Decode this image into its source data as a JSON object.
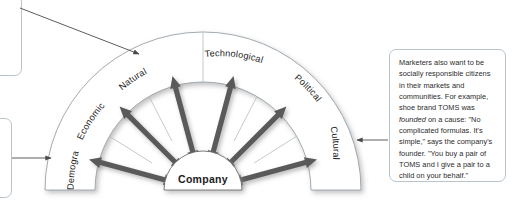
{
  "diagram": {
    "center_label": "Company",
    "segments": [
      {
        "id": "demographic",
        "label": "Demographic"
      },
      {
        "id": "economic",
        "label": "Economic"
      },
      {
        "id": "natural",
        "label": "Natural"
      },
      {
        "id": "technological",
        "label": "Technological"
      },
      {
        "id": "political",
        "label": "Political"
      },
      {
        "id": "cultural",
        "label": "Cultural"
      }
    ],
    "arrow_count": 6,
    "colors": {
      "arrow": "#5a5a5a",
      "arc_fill": "#ffffff",
      "arc_stroke": "#9aa3a8",
      "text": "#1c1c1c",
      "callout_border": "#b9c4cc",
      "connector": "#4a4a4a"
    }
  },
  "callouts": {
    "right": {
      "text_before_italic": "Marketers also want to be socially responsible citizens in their markets and communities. For example, shoe brand TOMS was ",
      "italic_word": "founded",
      "text_after_italic": " on a cause: \"No complicated formulas. It's simple,\" says the company's founder. \"You buy a pair of TOMS and I give a pair to a child on your behalf.\"",
      "points_to": "cultural"
    },
    "top_left": {
      "points_to": "natural"
    },
    "bottom_left": {
      "points_to": "demographic"
    }
  }
}
